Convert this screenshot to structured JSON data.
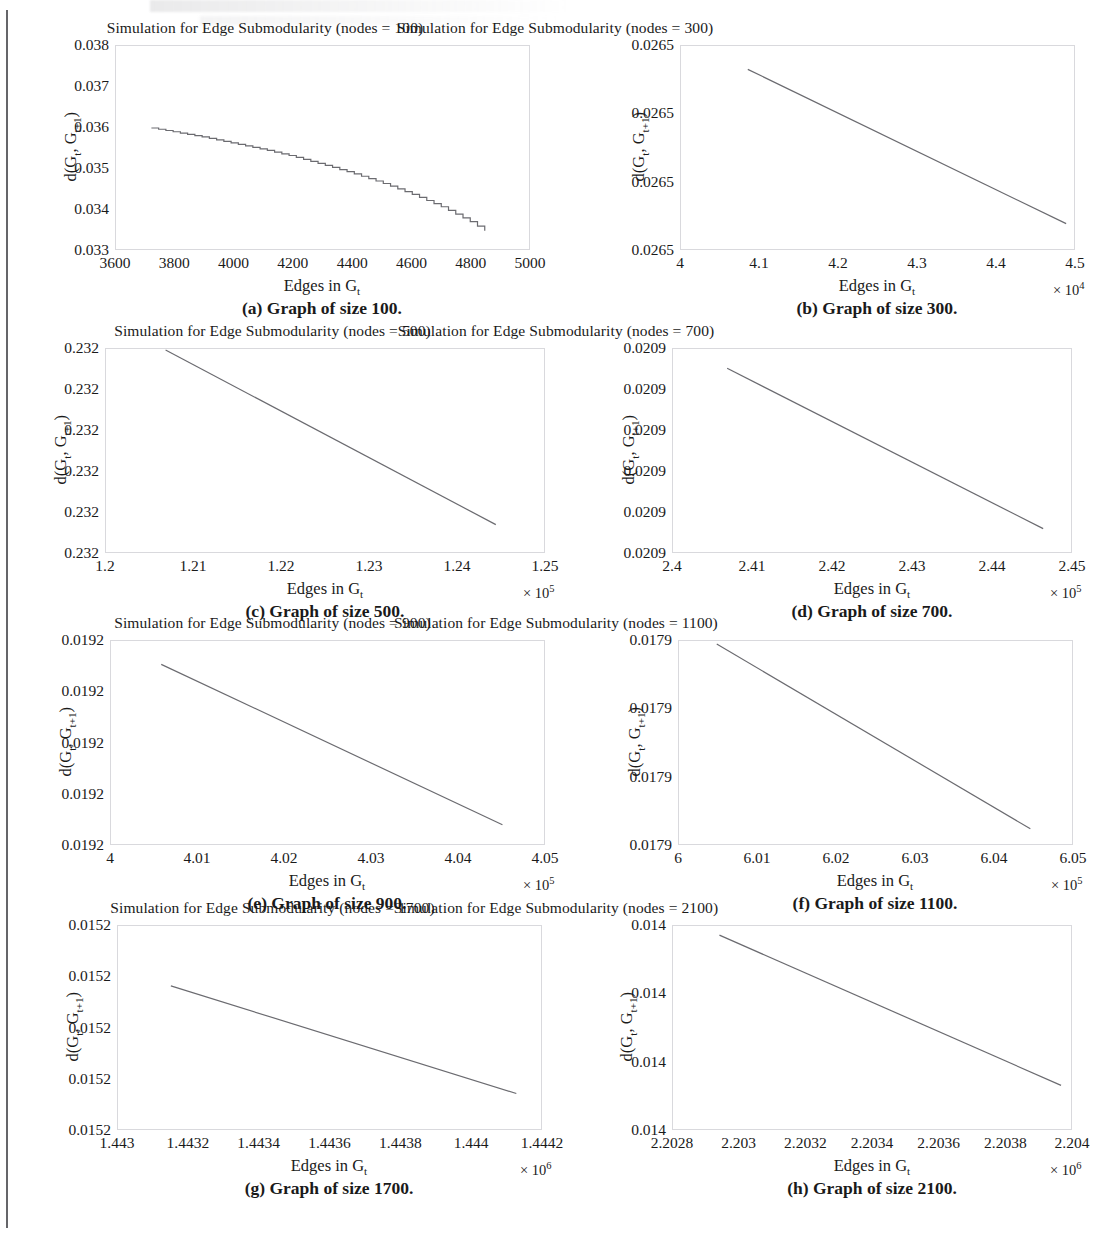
{
  "page": {
    "figure_label": "Simulation for Edge Submodularity",
    "axis_x_label": "Edges in G",
    "axis_x_label_sub": "t",
    "axis_y_label_prefix": "d(G",
    "axis_y_label_sub1": "t",
    "axis_y_label_mid": ", G",
    "axis_y_label_sub2": "t+1",
    "axis_y_label_suffix": ")",
    "multiplier_prefix": "× 10",
    "line_color": "#6b6b70",
    "frame_color": "#d9d9dd",
    "text_color": "#1a1a1a"
  },
  "chart_data": [
    {
      "id": "a",
      "type": "line",
      "title": "Simulation for Edge Submodularity (nodes = 100)",
      "caption": "(a) Graph of size 100.",
      "nodes": 100,
      "xlabel": "Edges in G_t",
      "ylabel": "d(G_t, G_t+1)",
      "xticks": [
        "3600",
        "3800",
        "4000",
        "4200",
        "4400",
        "4600",
        "4800",
        "5000"
      ],
      "xtick_values": [
        3600,
        3800,
        4000,
        4200,
        4400,
        4600,
        4800,
        5000
      ],
      "yticks": [
        "0.033",
        "0.034",
        "0.035",
        "0.036",
        "0.037",
        "0.038"
      ],
      "ytick_values": [
        0.033,
        0.034,
        0.035,
        0.036,
        0.037,
        0.038
      ],
      "xlim": [
        3600,
        5000
      ],
      "ylim": [
        0.033,
        0.038
      ],
      "multiplier": "",
      "grid": false,
      "legend": "none",
      "style": "staircase",
      "x": [
        3720,
        3800,
        3900,
        4000,
        4100,
        4200,
        4300,
        4400,
        4500,
        4600,
        4700,
        4800,
        4850
      ],
      "y": [
        0.03598,
        0.03588,
        0.03575,
        0.0356,
        0.03545,
        0.03528,
        0.03508,
        0.03487,
        0.03463,
        0.03436,
        0.03405,
        0.03368,
        0.03345
      ]
    },
    {
      "id": "b",
      "type": "line",
      "title": "Simulation for Edge Submodularity (nodes = 300)",
      "caption": "(b) Graph of size 300.",
      "nodes": 300,
      "xlabel": "Edges in G_t",
      "ylabel": "d(G_t, G_t+1)",
      "xticks": [
        "4",
        "4.1",
        "4.2",
        "4.3",
        "4.4",
        "4.5"
      ],
      "xtick_values": [
        4.0,
        4.1,
        4.2,
        4.3,
        4.4,
        4.5
      ],
      "yticks": [
        "0.0265",
        "0.0265",
        "0.0265",
        "0.0265"
      ],
      "ytick_values": [
        0,
        0.3333,
        0.6667,
        1.0
      ],
      "xlim": [
        4.0,
        4.5
      ],
      "ylim": [
        0,
        1
      ],
      "multiplier": "4",
      "grid": false,
      "legend": "none",
      "style": "line",
      "x": [
        4.085,
        4.49
      ],
      "y": [
        0.885,
        0.125
      ]
    },
    {
      "id": "c",
      "type": "line",
      "title": "Simulation for Edge Submodularity (nodes = 500)",
      "caption": "(c) Graph of size 500.",
      "nodes": 500,
      "xlabel": "Edges in G_t",
      "ylabel": "d(G_t, G_t+1)",
      "xticks": [
        "1.2",
        "1.21",
        "1.22",
        "1.23",
        "1.24",
        "1.25"
      ],
      "xtick_values": [
        1.2,
        1.21,
        1.22,
        1.23,
        1.24,
        1.25
      ],
      "yticks": [
        "0.232",
        "0.232",
        "0.232",
        "0.232",
        "0.232",
        "0.232"
      ],
      "ytick_values": [
        0,
        0.2,
        0.4,
        0.6,
        0.8,
        1.0
      ],
      "xlim": [
        1.2,
        1.25
      ],
      "ylim": [
        0,
        1
      ],
      "multiplier": "5",
      "grid": false,
      "legend": "none",
      "style": "line",
      "x": [
        1.2068,
        1.2445
      ],
      "y": [
        0.995,
        0.135
      ]
    },
    {
      "id": "d",
      "type": "line",
      "title": "Simulation for Edge Submodularity (nodes = 700)",
      "caption": "(d) Graph of size 700.",
      "nodes": 700,
      "xlabel": "Edges in G_t",
      "ylabel": "d(G_t, G_t+1)",
      "xticks": [
        "2.4",
        "2.41",
        "2.42",
        "2.43",
        "2.44",
        "2.45"
      ],
      "xtick_values": [
        2.4,
        2.41,
        2.42,
        2.43,
        2.44,
        2.45
      ],
      "yticks": [
        "0.0209",
        "0.0209",
        "0.0209",
        "0.0209",
        "0.0209",
        "0.0209"
      ],
      "ytick_values": [
        0,
        0.2,
        0.4,
        0.6,
        0.8,
        1.0
      ],
      "xlim": [
        2.4,
        2.45
      ],
      "ylim": [
        0,
        1
      ],
      "multiplier": "5",
      "grid": false,
      "legend": "none",
      "style": "line",
      "x": [
        2.4068,
        2.4465
      ],
      "y": [
        0.905,
        0.115
      ]
    },
    {
      "id": "e",
      "type": "line",
      "title": "Simulation for Edge Submodularity (nodes = 900)",
      "caption": "(e) Graph of size 900.",
      "nodes": 900,
      "xlabel": "Edges in G_t",
      "ylabel": "d(G_t, G_t+1)",
      "xticks": [
        "4",
        "4.01",
        "4.02",
        "4.03",
        "4.04",
        "4.05"
      ],
      "xtick_values": [
        4.0,
        4.01,
        4.02,
        4.03,
        4.04,
        4.05
      ],
      "yticks": [
        "0.0192",
        "0.0192",
        "0.0192",
        "0.0192",
        "0.0192"
      ],
      "ytick_values": [
        0,
        0.25,
        0.5,
        0.75,
        1.0
      ],
      "xlim": [
        4.0,
        4.05
      ],
      "ylim": [
        0,
        1
      ],
      "multiplier": "5",
      "grid": false,
      "legend": "none",
      "style": "line",
      "x": [
        4.0058,
        4.0452
      ],
      "y": [
        0.885,
        0.095
      ]
    },
    {
      "id": "f",
      "type": "line",
      "title": "Simulation for Edge Submodularity (nodes = 1100)",
      "caption": "(f) Graph of size 1100.",
      "nodes": 1100,
      "xlabel": "Edges in G_t",
      "ylabel": "d(G_t, G_t+1)",
      "xticks": [
        "6",
        "6.01",
        "6.02",
        "6.03",
        "6.04",
        "6.05"
      ],
      "xtick_values": [
        6.0,
        6.01,
        6.02,
        6.03,
        6.04,
        6.05
      ],
      "yticks": [
        "0.0179",
        "0.0179",
        "0.0179",
        "0.0179"
      ],
      "ytick_values": [
        0,
        0.3333,
        0.6667,
        1.0
      ],
      "xlim": [
        6.0,
        6.05
      ],
      "ylim": [
        0,
        1
      ],
      "multiplier": "5",
      "grid": false,
      "legend": "none",
      "style": "line",
      "x": [
        6.0048,
        6.0447
      ],
      "y": [
        0.985,
        0.075
      ]
    },
    {
      "id": "g",
      "type": "line",
      "title": "Simulation for Edge Submodularity (nodes = 1700)",
      "caption": "(g) Graph of size 1700.",
      "nodes": 1700,
      "xlabel": "Edges in G_t",
      "ylabel": "d(G_t, G_t+1)",
      "xticks": [
        "1.443",
        "1.4432",
        "1.4434",
        "1.4436",
        "1.4438",
        "1.444",
        "1.4442"
      ],
      "xtick_values": [
        1.443,
        1.4432,
        1.4434,
        1.4436,
        1.4438,
        1.444,
        1.4442
      ],
      "yticks": [
        "0.0152",
        "0.0152",
        "0.0152",
        "0.0152",
        "0.0152"
      ],
      "ytick_values": [
        0,
        0.25,
        0.5,
        0.75,
        1.0
      ],
      "xlim": [
        1.443,
        1.4442
      ],
      "ylim": [
        0,
        1
      ],
      "multiplier": "6",
      "grid": false,
      "legend": "none",
      "style": "line",
      "x": [
        1.44315,
        1.44413
      ],
      "y": [
        0.705,
        0.175
      ]
    },
    {
      "id": "h",
      "type": "line",
      "title": "Simulation for Edge Submodularity (nodes = 2100)",
      "caption": "(h) Graph of size 2100.",
      "nodes": 2100,
      "xlabel": "Edges in G_t",
      "ylabel": "d(G_t, G_t+1)",
      "xticks": [
        "2.2028",
        "2.203",
        "2.2032",
        "2.2034",
        "2.2036",
        "2.2038",
        "2.204"
      ],
      "xtick_values": [
        2.2028,
        2.203,
        2.2032,
        2.2034,
        2.2036,
        2.2038,
        2.204
      ],
      "yticks": [
        "0.014",
        "0.014",
        "0.014",
        "0.014"
      ],
      "ytick_values": [
        0,
        0.3333,
        0.6667,
        1.0
      ],
      "xlim": [
        2.2028,
        2.204
      ],
      "ylim": [
        0,
        1
      ],
      "multiplier": "6",
      "grid": false,
      "legend": "none",
      "style": "line",
      "x": [
        2.20294,
        2.20397
      ],
      "y": [
        0.955,
        0.215
      ]
    }
  ]
}
